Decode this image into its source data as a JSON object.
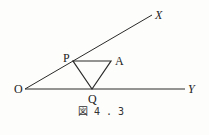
{
  "figure": {
    "caption": "図 4 . 3",
    "points": {
      "O": {
        "label": "O",
        "x": 25,
        "y": 89
      },
      "X": {
        "label": "X",
        "x": 152,
        "y": 15
      },
      "Y": {
        "label": "Y",
        "x": 185,
        "y": 89
      },
      "P": {
        "label": "P",
        "x": 73,
        "y": 61
      },
      "A": {
        "label": "A",
        "x": 111,
        "y": 61
      },
      "Q": {
        "label": "Q",
        "x": 92,
        "y": 89
      }
    },
    "segments": [
      [
        "O",
        "X"
      ],
      [
        "O",
        "Y"
      ],
      [
        "P",
        "A"
      ],
      [
        "A",
        "Q"
      ],
      [
        "Q",
        "P"
      ]
    ],
    "colors": {
      "line": "#2a2a2a",
      "background": "#fdfdfb"
    }
  }
}
